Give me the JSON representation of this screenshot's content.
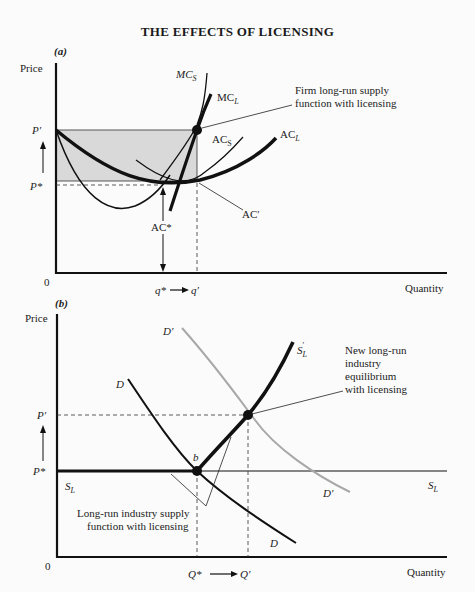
{
  "title": "THE EFFECTS OF LICENSING",
  "panel_a": {
    "label": "(a)",
    "y_axis_label": "Price",
    "x_axis_label": "Quantity",
    "origin": "0",
    "price_labels": {
      "p_prime": "P′",
      "p_star": "P*"
    },
    "quantity_labels": {
      "q_star": "q*",
      "arrow": "→",
      "q_prime": "q′"
    },
    "curve_labels": {
      "mc_s": {
        "main": "MC",
        "sub": "S"
      },
      "mc_l": {
        "main": "MC",
        "sub": "L"
      },
      "ac_s": {
        "main": "AC",
        "sub": "S"
      },
      "ac_l": {
        "main": "AC",
        "sub": "L"
      },
      "ac_prime": "AC′",
      "ac_star": "AC*"
    },
    "annotation": [
      "Firm long-run supply",
      "function with licensing"
    ]
  },
  "panel_b": {
    "label": "(b)",
    "y_axis_label": "Price",
    "x_axis_label": "Quantity",
    "origin": "0",
    "price_labels": {
      "p_prime": "P′",
      "p_star": "P*"
    },
    "quantity_labels": {
      "q_star": "Q*",
      "arrow": "→",
      "q_prime": "Q′"
    },
    "curve_labels": {
      "d": "D",
      "d_prime": "D′",
      "s_l_left": {
        "main": "S",
        "sub": "L"
      },
      "s_l_right": {
        "main": "S",
        "sub": "L"
      },
      "s_l_prime": {
        "main": "S",
        "sub": "L",
        "sup": "′"
      },
      "point_b": "b"
    },
    "annotation_equilibrium": [
      "New long-run",
      "industry",
      "equilibrium",
      "with licensing"
    ],
    "annotation_supply": [
      "Long-run industry supply",
      "function with licensing"
    ]
  },
  "colors": {
    "ink": "#1a1a1a",
    "shade": "#d9d9d9",
    "demand_shift": "#a8a8a8",
    "background": "#fbfbfb"
  }
}
